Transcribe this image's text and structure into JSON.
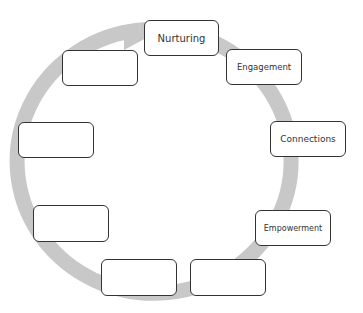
{
  "diagram": {
    "type": "cycle",
    "ring_color": "#c8c8c8",
    "border_color": "#333333",
    "nodes": [
      {
        "id": "nurturing",
        "label": "Nurturing",
        "x": 144,
        "y": 20,
        "w": 75,
        "h": 36,
        "font": 10
      },
      {
        "id": "engagement",
        "label": "Engagement",
        "x": 226,
        "y": 49,
        "w": 76,
        "h": 36,
        "font": 8.5
      },
      {
        "id": "connections",
        "label": "Connections",
        "x": 270,
        "y": 121,
        "w": 76,
        "h": 36,
        "font": 9
      },
      {
        "id": "empowerment",
        "label": "Empowerment",
        "x": 255,
        "y": 210,
        "w": 76,
        "h": 36,
        "font": 8
      },
      {
        "id": "blank-bottom-right",
        "label": "",
        "x": 190,
        "y": 259,
        "w": 76,
        "h": 37,
        "font": 9
      },
      {
        "id": "blank-bottom-left",
        "label": "",
        "x": 101,
        "y": 259,
        "w": 76,
        "h": 37,
        "font": 9
      },
      {
        "id": "blank-left-lower",
        "label": "",
        "x": 33,
        "y": 205,
        "w": 76,
        "h": 37,
        "font": 9
      },
      {
        "id": "blank-left-middle",
        "label": "",
        "x": 18,
        "y": 122,
        "w": 76,
        "h": 36,
        "font": 9
      },
      {
        "id": "blank-left-top",
        "label": "",
        "x": 62,
        "y": 50,
        "w": 76,
        "h": 36,
        "font": 9
      }
    ]
  }
}
